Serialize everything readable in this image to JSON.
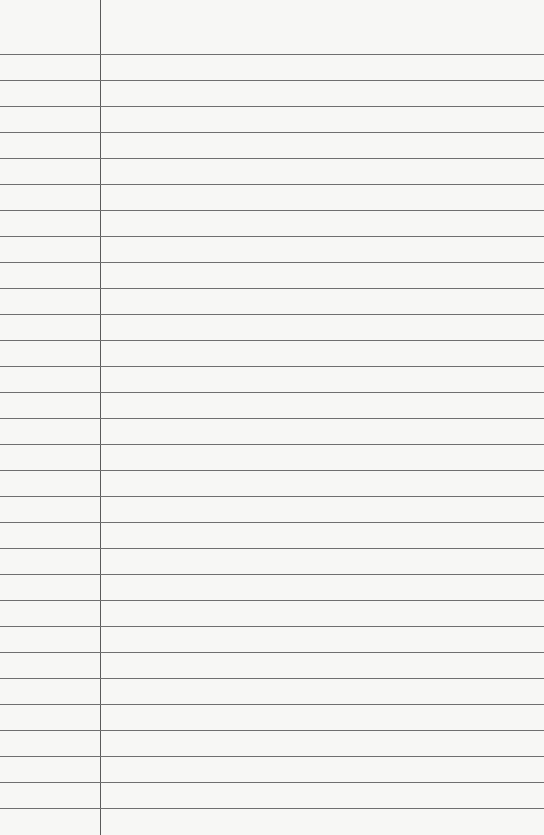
{
  "paper": {
    "type": "lined-notebook-paper",
    "background_color": "#f7f7f5",
    "rule_color": "#6f6f6f",
    "margin_color": "#5a5a5a",
    "margin_x": 100,
    "first_rule_y": 54,
    "rule_spacing": 26,
    "rule_count": 30
  }
}
